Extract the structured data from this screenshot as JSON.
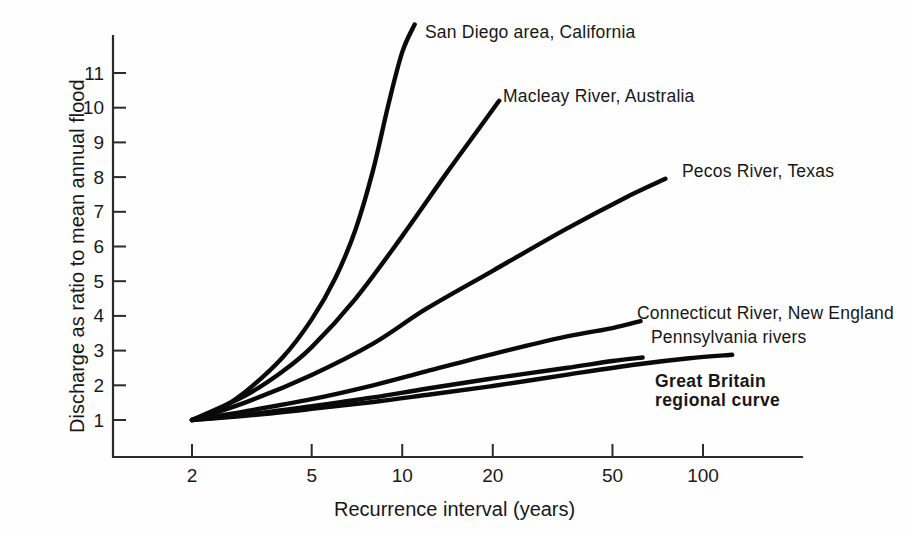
{
  "chart_data": {
    "type": "line",
    "title": "",
    "xlabel": "Recurrence interval (years)",
    "ylabel": "Discharge as ratio to mean annual flood",
    "xscale": "log",
    "xticks": [
      2,
      5,
      10,
      20,
      50,
      100
    ],
    "xtick_labels": [
      "2",
      "5",
      "10",
      "20",
      "50",
      "100"
    ],
    "xlim": [
      1.75,
      230
    ],
    "yticks": [
      1,
      2,
      3,
      4,
      5,
      6,
      7,
      8,
      9,
      10,
      11
    ],
    "ytick_labels": [
      "1",
      "2",
      "3",
      "4",
      "5",
      "6",
      "7",
      "8",
      "9",
      "10",
      "11"
    ],
    "ylim": [
      0,
      12.4
    ],
    "grid": false,
    "legend": "inline-annotations",
    "series": [
      {
        "name": "San Diego area, California",
        "bold": false,
        "points": [
          {
            "x": 2,
            "y": 1.0
          },
          {
            "x": 2.5,
            "y": 1.35
          },
          {
            "x": 3,
            "y": 1.8
          },
          {
            "x": 4,
            "y": 2.8
          },
          {
            "x": 5,
            "y": 3.9
          },
          {
            "x": 6,
            "y": 5.1
          },
          {
            "x": 7,
            "y": 6.5
          },
          {
            "x": 8,
            "y": 8.2
          },
          {
            "x": 9,
            "y": 10.1
          },
          {
            "x": 10,
            "y": 11.6
          },
          {
            "x": 11,
            "y": 12.4
          }
        ]
      },
      {
        "name": "Macleay River, Australia",
        "bold": false,
        "points": [
          {
            "x": 2,
            "y": 1.0
          },
          {
            "x": 3,
            "y": 1.7
          },
          {
            "x": 4,
            "y": 2.4
          },
          {
            "x": 5,
            "y": 3.1
          },
          {
            "x": 7,
            "y": 4.5
          },
          {
            "x": 10,
            "y": 6.3
          },
          {
            "x": 14,
            "y": 8.1
          },
          {
            "x": 18,
            "y": 9.4
          },
          {
            "x": 21,
            "y": 10.2
          }
        ]
      },
      {
        "name": "Pecos River, Texas",
        "bold": false,
        "points": [
          {
            "x": 2,
            "y": 1.0
          },
          {
            "x": 3,
            "y": 1.5
          },
          {
            "x": 5,
            "y": 2.3
          },
          {
            "x": 8,
            "y": 3.2
          },
          {
            "x": 12,
            "y": 4.2
          },
          {
            "x": 20,
            "y": 5.3
          },
          {
            "x": 35,
            "y": 6.5
          },
          {
            "x": 55,
            "y": 7.4
          },
          {
            "x": 75,
            "y": 7.95
          }
        ]
      },
      {
        "name": "Connecticut River, New England",
        "bold": false,
        "points": [
          {
            "x": 2,
            "y": 1.0
          },
          {
            "x": 3,
            "y": 1.25
          },
          {
            "x": 5,
            "y": 1.6
          },
          {
            "x": 8,
            "y": 2.0
          },
          {
            "x": 12,
            "y": 2.4
          },
          {
            "x": 20,
            "y": 2.9
          },
          {
            "x": 35,
            "y": 3.4
          },
          {
            "x": 50,
            "y": 3.65
          },
          {
            "x": 62,
            "y": 3.85
          }
        ]
      },
      {
        "name": "Pennsylvania rivers",
        "bold": false,
        "points": [
          {
            "x": 2,
            "y": 1.0
          },
          {
            "x": 3,
            "y": 1.15
          },
          {
            "x": 5,
            "y": 1.4
          },
          {
            "x": 8,
            "y": 1.65
          },
          {
            "x": 12,
            "y": 1.9
          },
          {
            "x": 20,
            "y": 2.2
          },
          {
            "x": 35,
            "y": 2.5
          },
          {
            "x": 50,
            "y": 2.7
          },
          {
            "x": 63,
            "y": 2.8
          }
        ]
      },
      {
        "name": "Great Britain regional curve",
        "bold": true,
        "points": [
          {
            "x": 2,
            "y": 1.0
          },
          {
            "x": 3,
            "y": 1.12
          },
          {
            "x": 5,
            "y": 1.32
          },
          {
            "x": 8,
            "y": 1.52
          },
          {
            "x": 12,
            "y": 1.72
          },
          {
            "x": 20,
            "y": 1.98
          },
          {
            "x": 35,
            "y": 2.3
          },
          {
            "x": 60,
            "y": 2.6
          },
          {
            "x": 90,
            "y": 2.78
          },
          {
            "x": 125,
            "y": 2.88
          }
        ]
      }
    ],
    "annotations": [
      {
        "id": "san-diego",
        "text": "San Diego area, California",
        "x": 425,
        "y": 22,
        "bold": false
      },
      {
        "id": "macleay",
        "text": "Macleay River, Australia",
        "x": 503,
        "y": 86,
        "bold": false
      },
      {
        "id": "pecos",
        "text": "Pecos River, Texas",
        "x": 682,
        "y": 161,
        "bold": false
      },
      {
        "id": "connecticut",
        "text": "Connecticut River, New England",
        "x": 637,
        "y": 303,
        "bold": false
      },
      {
        "id": "pennsylvania",
        "text": "Pennsylvania rivers",
        "x": 651,
        "y": 327,
        "bold": false
      },
      {
        "id": "great-britain-1",
        "text": "Great Britain",
        "x": 655,
        "y": 371,
        "bold": true
      },
      {
        "id": "great-britain-2",
        "text": "regional curve",
        "x": 655,
        "y": 390,
        "bold": true
      }
    ],
    "colors": {
      "curve": "#0a0a0a",
      "axis": "#2b2b2b",
      "text": "#171717",
      "background": "#fefefe"
    }
  }
}
